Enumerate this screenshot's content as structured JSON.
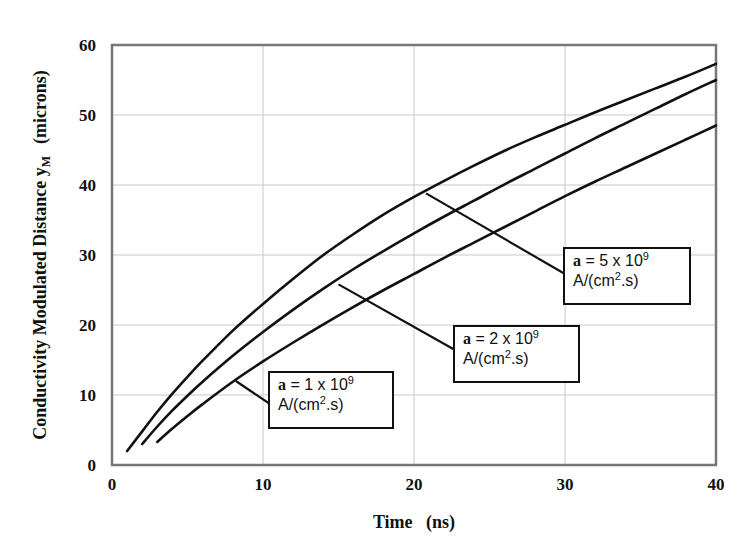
{
  "chart_data": {
    "type": "line",
    "title": "",
    "xlabel": "Time   (ns)",
    "ylabel": "Conductivity Modulated Distance y_M   (microns)",
    "ylabel_main": "Conductivity Modulated Distance y",
    "ylabel_sub": "M",
    "ylabel_unit": "(microns)",
    "xlim": [
      0,
      40
    ],
    "ylim": [
      0,
      60
    ],
    "xticks": [
      0,
      10,
      20,
      30,
      40
    ],
    "yticks": [
      0,
      10,
      20,
      30,
      40,
      50,
      60
    ],
    "grid": true,
    "legend": "annotation boxes with leader lines",
    "series": [
      {
        "name": "a = 5 x 10^9 A/(cm^2.s)",
        "x": [
          1,
          2,
          3,
          4,
          5,
          6,
          8,
          10,
          12,
          14,
          16,
          18,
          20,
          22,
          24,
          26,
          28,
          30,
          32,
          34,
          36,
          38,
          40
        ],
        "y": [
          2.0,
          4.8,
          7.6,
          10.2,
          12.6,
          14.9,
          19.2,
          23.0,
          26.6,
          30.0,
          33.0,
          35.8,
          38.3,
          40.6,
          42.8,
          44.9,
          46.8,
          48.6,
          50.4,
          52.1,
          53.8,
          55.5,
          57.3
        ]
      },
      {
        "name": "a = 2 x 10^9 A/(cm^2.s)",
        "x": [
          2,
          3,
          4,
          5,
          6,
          8,
          10,
          12,
          14,
          16,
          18,
          20,
          22,
          24,
          26,
          28,
          30,
          32,
          34,
          36,
          38,
          40
        ],
        "y": [
          3.0,
          5.5,
          7.8,
          9.9,
          11.9,
          15.6,
          19.0,
          22.2,
          25.2,
          28.0,
          30.6,
          33.1,
          35.5,
          37.8,
          40.1,
          42.3,
          44.5,
          46.7,
          48.8,
          50.9,
          53.0,
          55.0
        ]
      },
      {
        "name": "a = 1 x 10^9 A/(cm^2.s)",
        "x": [
          3,
          4,
          5,
          6,
          8,
          10,
          12,
          14,
          16,
          18,
          20,
          22,
          24,
          26,
          28,
          30,
          32,
          34,
          36,
          38,
          40
        ],
        "y": [
          3.3,
          5.2,
          7.0,
          8.7,
          11.9,
          14.8,
          17.5,
          20.1,
          22.6,
          25.0,
          27.3,
          29.6,
          31.8,
          34.0,
          36.2,
          38.4,
          40.5,
          42.5,
          44.5,
          46.5,
          48.5
        ]
      }
    ],
    "annotations": [
      {
        "line1_prefix": "a",
        "line1_rest": " = 5 x 10",
        "exp": "9",
        "line2_pre": "A/(cm",
        "line2_exp": "2",
        "line2_post": ".s)",
        "pointer_x": 20.8,
        "pointer_y": 38.8
      },
      {
        "line1_prefix": "a",
        "line1_rest": " = 2 x 10",
        "exp": "9",
        "line2_pre": "A/(cm",
        "line2_exp": "2",
        "line2_post": ".s)",
        "pointer_x": 15.0,
        "pointer_y": 25.8
      },
      {
        "line1_prefix": "a",
        "line1_rest": " = 1 x 10",
        "exp": "9",
        "line2_pre": "A/(cm",
        "line2_exp": "2",
        "line2_post": ".s)",
        "pointer_x": 8.2,
        "pointer_y": 12.0
      }
    ]
  }
}
